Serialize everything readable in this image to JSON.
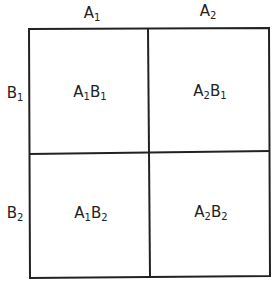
{
  "diagram": {
    "type": "2x2 factorial grid",
    "column_headers": [
      {
        "letter": "A",
        "sub": "1"
      },
      {
        "letter": "A",
        "sub": "2"
      }
    ],
    "row_headers": [
      {
        "letter": "B",
        "sub": "1"
      },
      {
        "letter": "B",
        "sub": "2"
      }
    ],
    "cells": [
      [
        {
          "a": "A",
          "as": "1",
          "b": "B",
          "bs": "1"
        },
        {
          "a": "A",
          "as": "2",
          "b": "B",
          "bs": "1"
        }
      ],
      [
        {
          "a": "A",
          "as": "1",
          "b": "B",
          "bs": "2"
        },
        {
          "a": "A",
          "as": "2",
          "b": "B",
          "bs": "2"
        }
      ]
    ],
    "line_color": "#222222"
  }
}
